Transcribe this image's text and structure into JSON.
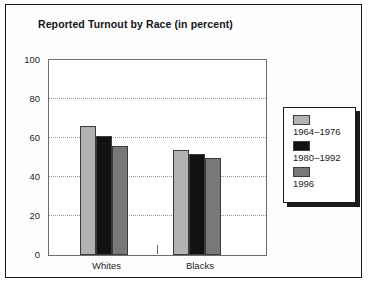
{
  "chart_data": {
    "type": "bar",
    "title": "Reported Turnout by Race (in percent)",
    "xlabel": "",
    "ylabel": "",
    "ylim": [
      0,
      100
    ],
    "yticks": [
      0,
      20,
      40,
      60,
      80,
      100
    ],
    "grid": true,
    "legend_position": "right",
    "categories": [
      "Whites",
      "Blacks"
    ],
    "series": [
      {
        "name": "1964–1976",
        "color": "#b2b2b2",
        "values": [
          66,
          54
        ]
      },
      {
        "name": "1980–1992",
        "color": "#121212",
        "values": [
          61,
          52
        ]
      },
      {
        "name": "1996",
        "color": "#787878",
        "values": [
          56,
          50
        ]
      }
    ]
  },
  "axis": {
    "tick_labels": [
      "100",
      "80",
      "60",
      "40",
      "20",
      "0"
    ]
  }
}
